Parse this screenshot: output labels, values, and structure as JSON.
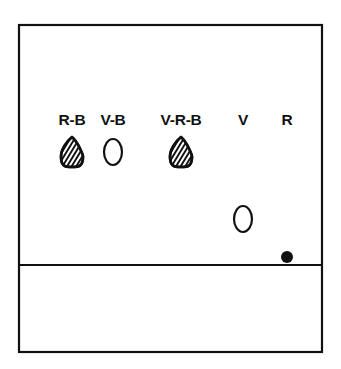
{
  "figure": {
    "background_color": "#ffffff",
    "line_color": "#111111",
    "frame": {
      "name": "outer-frame",
      "x": 19,
      "y": 25,
      "width": 303,
      "height": 327
    },
    "divider": {
      "name": "horizontal-divider",
      "y": 265,
      "x1": 19,
      "x2": 322
    },
    "columns": [
      {
        "label": "R-B",
        "label_x": 72,
        "label_y": 125,
        "symbol": {
          "type": "teardrop-hatched",
          "name": "hatched-teardrop-symbol",
          "cx": 72,
          "cy": 152,
          "rx": 11,
          "ry": 15
        }
      },
      {
        "label": "V-B",
        "label_x": 113,
        "label_y": 125,
        "symbol": {
          "type": "ellipse-open",
          "name": "open-ellipse-symbol",
          "cx": 113,
          "cy": 152,
          "rx": 9,
          "ry": 13
        }
      },
      {
        "label": "V-R-B",
        "label_x": 181,
        "label_y": 125,
        "symbol": {
          "type": "teardrop-hatched",
          "name": "hatched-teardrop-symbol",
          "cx": 181,
          "cy": 152,
          "rx": 11,
          "ry": 15
        }
      },
      {
        "label": "V",
        "label_x": 243,
        "label_y": 125,
        "symbol": {
          "type": "ellipse-open",
          "name": "open-ellipse-symbol",
          "cx": 243,
          "cy": 219,
          "rx": 9,
          "ry": 13
        }
      },
      {
        "label": "R",
        "label_x": 287,
        "label_y": 125,
        "symbol": {
          "type": "dot-filled",
          "name": "filled-dot-symbol",
          "cx": 287,
          "cy": 257,
          "r": 6
        }
      }
    ]
  }
}
